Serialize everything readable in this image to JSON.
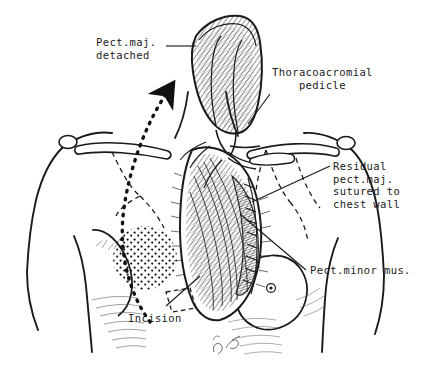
{
  "figure": {
    "background_color": "#ffffff",
    "ink_color": "#1a1a1a",
    "width": 425,
    "height": 369
  },
  "labels": {
    "pect_maj_detached": "Pect.maj.\ndetached",
    "thoracoacromial_pedicle": "Thoracoacromial\n    pedicle",
    "residual_pect_maj": "Residual\npect.maj.\nsutured to\nchest wall",
    "pect_minor_mus": "Pect.minor mus.",
    "incision": "Incision"
  },
  "annotations": {
    "flap_arrow": "dotted-curved-arrow-showing-flap-rotation",
    "dashed_outline": "original-pectoralis-major-borders",
    "incision_marker": "dashed-rectangle-incision-site",
    "signature": "artist-monogram"
  },
  "anatomy_parts": [
    "torso-outline",
    "left-shoulder",
    "right-shoulder",
    "left-clavicle",
    "right-clavicle",
    "sternal-notch",
    "left-breast",
    "right-breast",
    "areola-stipple",
    "open-wound-cavity",
    "elevated-muscle-flap",
    "pectoralis-minor-muscle",
    "vascular-pedicle",
    "suture-line",
    "umbilicus"
  ]
}
